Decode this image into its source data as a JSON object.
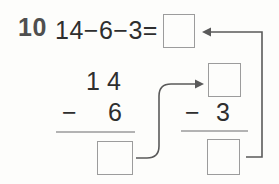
{
  "problem": {
    "number": "10",
    "expression": "14−6−3=",
    "answer_value": ""
  },
  "step1": {
    "minuend": "14",
    "operator": "−",
    "subtrahend": "6",
    "result_value": ""
  },
  "step2": {
    "input_value": "",
    "operator": "−",
    "subtrahend": "3",
    "result_value": ""
  },
  "arrows": {
    "step1_to_step2": "carry-result-right-arrow",
    "step2_to_answer": "return-to-answer-left-arrow"
  },
  "colors": {
    "text": "#2e2e2e",
    "problem_number": "#4f4f4f",
    "box_border": "#9c9c9c",
    "rule": "#b3b3b3",
    "arrow": "#5a5a5a",
    "background": "#fdfdfb"
  }
}
